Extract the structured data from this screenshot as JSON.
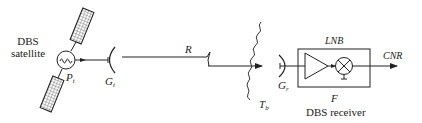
{
  "diagram": {
    "satellite": {
      "label_line1": "DBS",
      "label_line2": "satellite",
      "power_label": "P",
      "power_sub": "t",
      "icon": "sine-source-icon"
    },
    "transmit_antenna": {
      "label": "G",
      "sub": "t"
    },
    "path": {
      "label": "R"
    },
    "noise": {
      "label": "T",
      "sub": "b"
    },
    "receive_antenna": {
      "label": "G",
      "sub": "r"
    },
    "lnb": {
      "label": "LNB",
      "noise_figure_label": "F",
      "components": [
        "amplifier",
        "mixer"
      ]
    },
    "receiver": {
      "label": "DBS receiver"
    },
    "output": {
      "label": "CNR"
    },
    "colors": {
      "stroke": "#222222",
      "background": "#ffffff"
    }
  }
}
